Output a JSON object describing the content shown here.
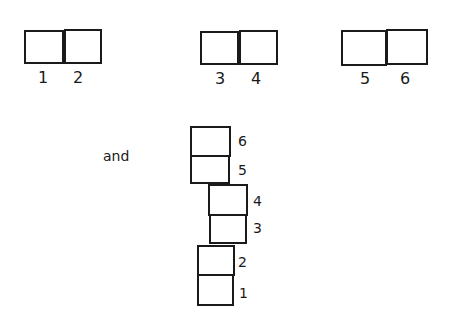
{
  "diagram": {
    "pairs": [
      {
        "left": {
          "label": "1"
        },
        "right": {
          "label": "2"
        }
      },
      {
        "left": {
          "label": "3"
        },
        "right": {
          "label": "4"
        }
      },
      {
        "left": {
          "label": "5"
        },
        "right": {
          "label": "6"
        }
      }
    ],
    "connector_text": "and",
    "stack": [
      {
        "label": "6"
      },
      {
        "label": "5"
      },
      {
        "label": "4"
      },
      {
        "label": "3"
      },
      {
        "label": "2"
      },
      {
        "label": "1"
      }
    ]
  }
}
